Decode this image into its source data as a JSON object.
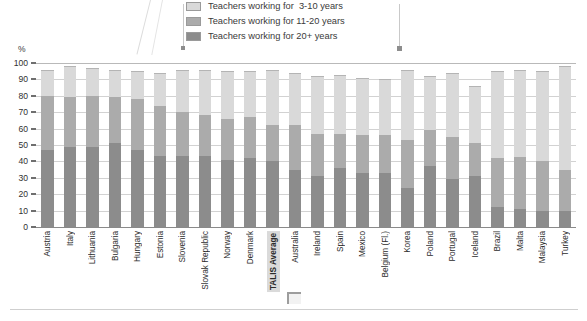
{
  "axis": {
    "unit_label": "%",
    "ticks": [
      0,
      10,
      20,
      30,
      40,
      50,
      60,
      70,
      80,
      90,
      100
    ]
  },
  "legend": {
    "items": [
      {
        "label": "Teachers working for  3-10 years",
        "color": "#d9d9d9",
        "key": "3-10"
      },
      {
        "label": "Teachers working for 11-20 years",
        "color": "#ababab",
        "key": "11-20"
      },
      {
        "label": "Teachers working for 20+ years",
        "color": "#8c8c8c",
        "key": "20+"
      }
    ]
  },
  "chart_data": {
    "type": "bar",
    "stacked": true,
    "title": "",
    "xlabel": "",
    "ylabel": "%",
    "ylim": [
      0,
      100
    ],
    "grid": true,
    "legend_position": "top",
    "categories": [
      "Austria",
      "Italy",
      "Lithuania",
      "Bulgaria",
      "Hungary",
      "Estonia",
      "Slovenia",
      "Slovak Republic",
      "Norway",
      "Denmark",
      "TALIS Average",
      "Australia",
      "Ireland",
      "Spain",
      "Mexico",
      "Belgium (Fl.)",
      "Korea",
      "Poland",
      "Portugal",
      "Iceland",
      "Brazil",
      "Malta",
      "Malaysia",
      "Turkey"
    ],
    "highlight_category": "TALIS Average",
    "series": [
      {
        "name": "Teachers working for 20+ years",
        "color": "#8c8c8c",
        "values": [
          47,
          49,
          49,
          51,
          47,
          43,
          43,
          43,
          41,
          42,
          40,
          35,
          31,
          36,
          33,
          33,
          24,
          37,
          29,
          31,
          12,
          11,
          10,
          10
        ]
      },
      {
        "name": "Teachers working for 11-20 years",
        "color": "#ababab",
        "values": [
          33,
          30,
          31,
          28,
          31,
          31,
          27,
          25,
          25,
          25,
          22,
          27,
          26,
          21,
          23,
          23,
          29,
          22,
          26,
          20,
          30,
          32,
          30,
          25
        ]
      },
      {
        "name": "Teachers working for 3-10 years",
        "color": "#d9d9d9",
        "values": [
          16,
          19,
          17,
          17,
          17,
          20,
          26,
          28,
          29,
          28,
          34,
          32,
          35,
          36,
          35,
          34,
          43,
          33,
          39,
          35,
          53,
          53,
          55,
          63
        ]
      }
    ],
    "totals": [
      96,
      98,
      97,
      96,
      95,
      94,
      96,
      96,
      95,
      95,
      96,
      94,
      92,
      93,
      91,
      90,
      96,
      92,
      94,
      86,
      95,
      96,
      95,
      98
    ]
  }
}
